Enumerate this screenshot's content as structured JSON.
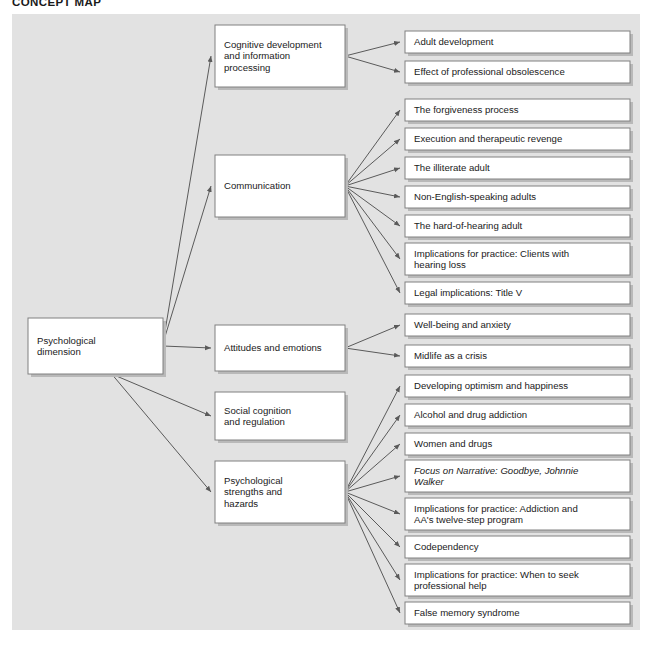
{
  "page": {
    "title": "CONCEPT MAP",
    "background_color": "#e2e2e2",
    "box_fill": "#ffffff",
    "box_border_color": "#808080",
    "connector_color": "#5a5a5a",
    "text_color": "#1a1a1a"
  },
  "diagram": {
    "type": "concept-map",
    "root": {
      "id": "root",
      "lines": [
        "Psychological",
        "dimension"
      ],
      "x": 28,
      "y": 318,
      "w": 135,
      "h": 56
    },
    "branches": [
      {
        "id": "cognitive-development",
        "lines": [
          "Cognitive development",
          "and information",
          "processing"
        ],
        "x": 215,
        "y": 25,
        "w": 130,
        "h": 62,
        "leaves": [
          {
            "id": "adult-development",
            "lines": [
              "Adult development"
            ],
            "x": 405,
            "y": 31,
            "w": 225,
            "h": 22
          },
          {
            "id": "professional-obsolescence",
            "lines": [
              "Effect of professional obsolescence"
            ],
            "x": 405,
            "y": 61,
            "w": 225,
            "h": 22
          }
        ]
      },
      {
        "id": "communication",
        "lines": [
          "Communication"
        ],
        "x": 215,
        "y": 155,
        "w": 130,
        "h": 62,
        "leaves": [
          {
            "id": "forgiveness-process",
            "lines": [
              "The forgiveness process"
            ],
            "x": 405,
            "y": 99,
            "w": 225,
            "h": 22
          },
          {
            "id": "execution-therapeutic-revenge",
            "lines": [
              "Execution and therapeutic revenge"
            ],
            "x": 405,
            "y": 128,
            "w": 225,
            "h": 22
          },
          {
            "id": "illiterate-adult",
            "lines": [
              "The illiterate adult"
            ],
            "x": 405,
            "y": 157,
            "w": 225,
            "h": 22
          },
          {
            "id": "non-english-speaking-adults",
            "lines": [
              "Non-English-speaking adults"
            ],
            "x": 405,
            "y": 186,
            "w": 225,
            "h": 22
          },
          {
            "id": "hard-of-hearing-adult",
            "lines": [
              "The hard-of-hearing adult"
            ],
            "x": 405,
            "y": 215,
            "w": 225,
            "h": 22
          },
          {
            "id": "implications-hearing-loss",
            "lines": [
              "Implications for practice: Clients with",
              "    hearing loss"
            ],
            "x": 405,
            "y": 243,
            "w": 225,
            "h": 32
          },
          {
            "id": "legal-implications-title-v",
            "lines": [
              "Legal implications: Title V"
            ],
            "x": 405,
            "y": 282,
            "w": 225,
            "h": 22
          }
        ]
      },
      {
        "id": "attitudes-emotions",
        "lines": [
          "Attitudes and emotions"
        ],
        "x": 215,
        "y": 325,
        "w": 130,
        "h": 46,
        "leaves": [
          {
            "id": "well-being-anxiety",
            "lines": [
              "Well-being and anxiety"
            ],
            "x": 405,
            "y": 314,
            "w": 225,
            "h": 22
          },
          {
            "id": "midlife-crisis",
            "lines": [
              "Midlife as a crisis"
            ],
            "x": 405,
            "y": 345,
            "w": 225,
            "h": 22
          }
        ]
      },
      {
        "id": "social-cognition",
        "lines": [
          "Social cognition",
          "and regulation"
        ],
        "x": 215,
        "y": 392,
        "w": 130,
        "h": 48,
        "leaves": []
      },
      {
        "id": "psychological-strengths",
        "lines": [
          "Psychological",
          "strengths and",
          "hazards"
        ],
        "x": 215,
        "y": 461,
        "w": 130,
        "h": 62,
        "leaves": [
          {
            "id": "developing-optimism",
            "lines": [
              "Developing optimism and happiness"
            ],
            "x": 405,
            "y": 375,
            "w": 225,
            "h": 22
          },
          {
            "id": "alcohol-drug-addiction",
            "lines": [
              "Alcohol and drug addiction"
            ],
            "x": 405,
            "y": 404,
            "w": 225,
            "h": 22
          },
          {
            "id": "women-and-drugs",
            "lines": [
              "Women and drugs"
            ],
            "x": 405,
            "y": 433,
            "w": 225,
            "h": 22
          },
          {
            "id": "focus-on-narrative",
            "lines": [
              "Focus on Narrative: Goodbye, Johnnie",
              "    Walker"
            ],
            "x": 405,
            "y": 460,
            "w": 225,
            "h": 32,
            "italic": true
          },
          {
            "id": "implications-aa-twelve-step",
            "lines": [
              "Implications for practice: Addiction and",
              "    AA's twelve-step program"
            ],
            "x": 405,
            "y": 498,
            "w": 225,
            "h": 32
          },
          {
            "id": "codependency",
            "lines": [
              "Codependency"
            ],
            "x": 405,
            "y": 536,
            "w": 225,
            "h": 22
          },
          {
            "id": "implications-professional-help",
            "lines": [
              "Implications for practice: When to seek",
              "    professional help"
            ],
            "x": 405,
            "y": 564,
            "w": 225,
            "h": 32
          },
          {
            "id": "false-memory-syndrome",
            "lines": [
              "False memory syndrome"
            ],
            "x": 405,
            "y": 602,
            "w": 225,
            "h": 22
          }
        ]
      }
    ]
  }
}
